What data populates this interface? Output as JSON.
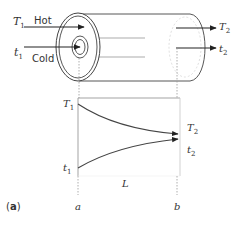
{
  "figure": {
    "panel_label": "(a)",
    "panel_letter": "a",
    "colors": {
      "line": "#3a3a3a",
      "faint": "#bdbdbd",
      "text": "#333333"
    }
  },
  "exchanger": {
    "hot_label": "Hot",
    "cold_label": "Cold",
    "inlet_hot": {
      "sym": "T",
      "sub": "1"
    },
    "inlet_cold": {
      "sym": "t",
      "sub": "1"
    },
    "outlet_hot": {
      "sym": "T",
      "sub": "2"
    },
    "outlet_cold": {
      "sym": "t",
      "sub": "2"
    }
  },
  "profile": {
    "y_top_label": {
      "sym": "T",
      "sub": "1"
    },
    "y_bottom_label": {
      "sym": "t",
      "sub": "1"
    },
    "right_top_label": {
      "sym": "T",
      "sub": "2"
    },
    "right_bottom_label": {
      "sym": "t",
      "sub": "2"
    },
    "length_label": "L",
    "x_start_label": "a",
    "x_end_label": "b"
  }
}
